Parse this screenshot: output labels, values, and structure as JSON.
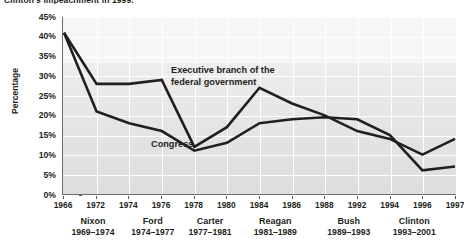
{
  "chart_data": {
    "type": "line",
    "title": "Clinton's impeachment in 1999.",
    "xlabel": "",
    "ylabel": "Percentage",
    "ylim": [
      0,
      45
    ],
    "ytick_labels": [
      "45%",
      "40%",
      "35%",
      "30%",
      "25%",
      "20%",
      "15%",
      "10%",
      "5%",
      "0%"
    ],
    "ytick_values": [
      45,
      40,
      35,
      30,
      25,
      20,
      15,
      10,
      5,
      0
    ],
    "xtick_labels": [
      "1966",
      "1972",
      "1974",
      "1976",
      "1978",
      "1980",
      "1984",
      "1986",
      "1988",
      "1992",
      "1994",
      "1996",
      "1997"
    ],
    "xtick_values": [
      1966,
      1972,
      1974,
      1976,
      1978,
      1980,
      1984,
      1986,
      1988,
      1992,
      1994,
      1996,
      1997
    ],
    "x": [
      1966,
      1972,
      1974,
      1976,
      1978,
      1980,
      1984,
      1986,
      1988,
      1992,
      1994,
      1996,
      1997
    ],
    "grid": true,
    "legend_position": "inline-annotation",
    "series": [
      {
        "name": "Executive branch of the federal government",
        "label": "Executive branch of the\nfederal government",
        "color": "#231f20",
        "values": [
          41,
          28,
          28,
          29,
          12,
          17,
          27,
          23,
          20,
          16,
          14,
          10,
          14
        ]
      },
      {
        "name": "Congress",
        "label": "Congress",
        "color": "#231f20",
        "values": [
          41,
          21,
          18,
          16,
          11,
          13,
          18,
          19,
          19.5,
          19,
          15,
          6,
          7
        ]
      }
    ],
    "presidents": [
      {
        "name": "Nixon",
        "years": "1969–1974",
        "center_year": 1971.5
      },
      {
        "name": "Ford",
        "years": "1974–1977",
        "center_year": 1975.5
      },
      {
        "name": "Carter",
        "years": "1977–1981",
        "center_year": 1979.0
      },
      {
        "name": "Reagan",
        "years": "1981–1989",
        "center_year": 1985.0
      },
      {
        "name": "Bush",
        "years": "1989–1993",
        "center_year": 1991.0
      },
      {
        "name": "Clinton",
        "years": "1993–2001",
        "center_year": 1995.5
      }
    ],
    "colors": {
      "line": "#231f20",
      "plot_background": "#e9e9e9",
      "gridline": "#ffffff",
      "axis": "#6d6e71",
      "text": "#231f20"
    }
  }
}
